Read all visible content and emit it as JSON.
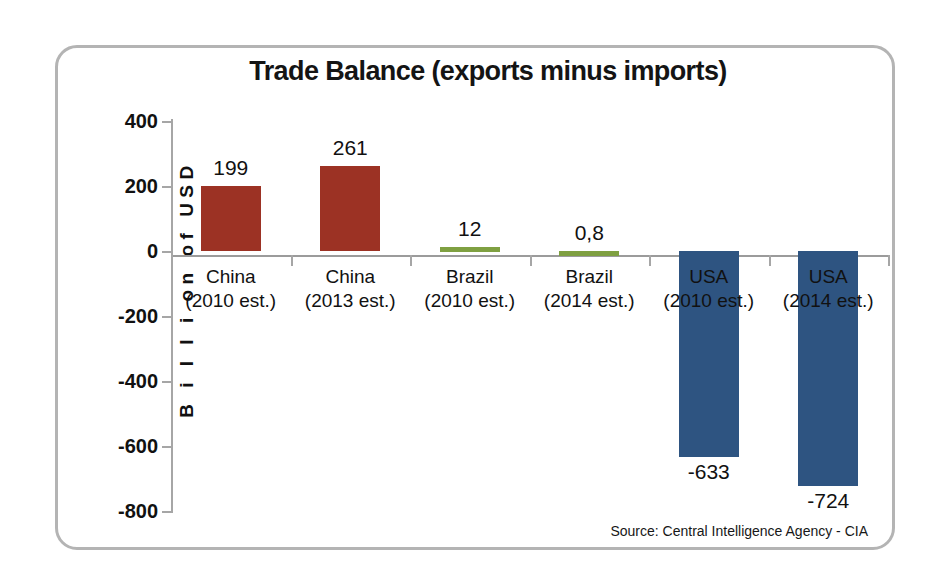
{
  "chart_data": {
    "type": "bar",
    "title": "Trade Balance (exports minus imports)",
    "xlabel": "",
    "ylabel": "B i l l i on  of  USD",
    "ylim": [
      -800,
      400
    ],
    "ytick_values": [
      400,
      200,
      0,
      -200,
      -400,
      -600,
      -800
    ],
    "ytick_labels": [
      "400",
      "200",
      "0",
      "-200",
      "-400",
      "-600",
      "-800"
    ],
    "grid": false,
    "legend": "none",
    "categories": [
      {
        "name": "China",
        "sub": "(2010 est.)"
      },
      {
        "name": "China",
        "sub": "(2013 est.)"
      },
      {
        "name": "Brazil",
        "sub": "(2010 est.)"
      },
      {
        "name": "Brazil",
        "sub": "(2014 est.)"
      },
      {
        "name": "USA",
        "sub": "(2010 est.)"
      },
      {
        "name": "USA",
        "sub": "(2014 est.)"
      }
    ],
    "values": [
      199,
      261,
      12,
      0.8,
      -633,
      -724
    ],
    "value_labels": [
      "199",
      "261",
      "12",
      "0,8",
      "-633",
      "-724"
    ],
    "bar_colors": [
      "#9c3224",
      "#9c3224",
      "#7fa041",
      "#7fa041",
      "#2e5481",
      "#2e5481"
    ],
    "source": "Source: Central Intelligence Agency - CIA"
  },
  "colors": {
    "red": "#9c3224",
    "green": "#7fa041",
    "blue": "#2e5481",
    "frame": "#b4b4b4",
    "axis": "#a6a6a6",
    "text": "#111111"
  }
}
